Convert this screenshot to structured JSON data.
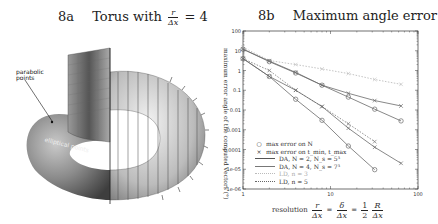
{
  "left_panel": {
    "title_number": "8a",
    "title_text": "Torus with",
    "title_frac_num": "r",
    "title_frac_den": "Δx",
    "title_eq": "= 4",
    "labels": {
      "parabolic": "parabolic points",
      "parabolic_line1": "parabolic",
      "parabolic_line2": "points",
      "elliptical": "elliptical points"
    }
  },
  "right_panel": {
    "title_number": "8b",
    "title_text": "Maximum angle error",
    "ylabel": "maximum error angle of the computed vectors (°)",
    "xlabel_prefix": "resolution",
    "xlabel_eq": "r/Δx = δ/Δx = ½ R/Δx",
    "x_ticks": [
      "1",
      "10",
      "100"
    ],
    "y_ticks": [
      "100",
      "10",
      "1",
      "0.1",
      "0.01",
      "0.001",
      "0.0001",
      "1e-05",
      "1e-06"
    ],
    "legend": [
      {
        "marker": "circle",
        "label": "max error on N"
      },
      {
        "marker": "cross",
        "label": "max error on t_min, t_max"
      },
      {
        "style": "solid-dark",
        "label": "DA, N = 2, N_s = 5³"
      },
      {
        "style": "solid-mid",
        "label": "DA, N = 4, N_s = 7³"
      },
      {
        "style": "dotted-light",
        "label": "LD, n = 3"
      },
      {
        "style": "dotted-dark",
        "label": "LD, n = 5"
      }
    ]
  },
  "chart_data": [
    {
      "type": "image",
      "title": "8a Torus with r/Δx = 4",
      "annotations": [
        "parabolic points",
        "elliptical points"
      ]
    },
    {
      "type": "line",
      "title": "8b Maximum angle error",
      "xlabel": "resolution r/Δx = δ/Δx = 1/2 R/Δx",
      "ylabel": "maximum error angle of the computed vectors (°)",
      "xscale": "log",
      "yscale": "log",
      "xlim": [
        1,
        100
      ],
      "ylim": [
        1e-06,
        100
      ],
      "x_ticks": [
        1,
        10,
        100
      ],
      "y_ticks": [
        100,
        10,
        1,
        0.1,
        0.01,
        0.001,
        0.0001,
        1e-05,
        1e-06
      ],
      "grid": false,
      "legend_position": "lower left",
      "x": [
        1,
        2,
        4,
        8,
        16,
        32,
        64
      ],
      "series": [
        {
          "name": "LD, n = 3 (max error on t_min, t_max)",
          "marker": "cross",
          "style": "dotted-light",
          "values": [
            15,
            3.2,
            2.0,
            1.2,
            0.7,
            0.35,
            0.2
          ]
        },
        {
          "name": "DA, N = 2, N_s = 5³ (max error on t_min, t_max)",
          "marker": "cross",
          "style": "solid",
          "values": [
            12,
            3.0,
            0.8,
            0.18,
            0.07,
            0.03,
            0.016
          ]
        },
        {
          "name": "DA, N = 2, N_s = 5³ (max error on N)",
          "marker": "circle",
          "style": "solid",
          "values": [
            12,
            2.8,
            0.75,
            0.18,
            0.045,
            0.011,
            0.0028
          ]
        },
        {
          "name": "LD, n = 5 (max error on t_min, t_max)",
          "marker": "cross",
          "style": "dotted-dark",
          "values": [
            4,
            1.0,
            0.1,
            0.015,
            0.002,
            0.00025,
            null
          ]
        },
        {
          "name": "DA, N = 4, N_s = 7³ (max error on t_min, t_max)",
          "marker": "cross",
          "style": "solid",
          "values": [
            4,
            0.5,
            0.1,
            0.015,
            0.0012,
            0.00013,
            2e-05
          ]
        },
        {
          "name": "DA, N = 4, N_s = 7³ (max error on N)",
          "marker": "circle",
          "style": "solid",
          "values": [
            4,
            0.5,
            0.035,
            0.003,
            0.00015,
            9.5e-06,
            8e-07
          ]
        }
      ]
    }
  ]
}
